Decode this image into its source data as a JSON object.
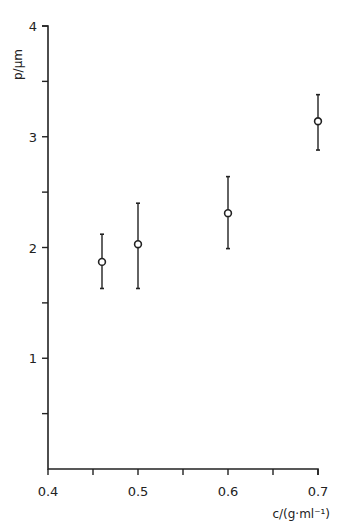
{
  "chart_data": {
    "type": "scatter",
    "title": "",
    "xlabel": "c/(g·ml⁻¹)",
    "ylabel": "p/µm",
    "xlim": [
      0.4,
      0.7
    ],
    "ylim": [
      0,
      4
    ],
    "x_ticks": [
      0.4,
      0.45,
      0.5,
      0.55,
      0.6,
      0.65,
      0.7
    ],
    "x_tick_labels": [
      "0.4",
      "",
      "0.5",
      "",
      "0.6",
      "",
      "0.7"
    ],
    "y_ticks": [
      0.5,
      1,
      1.5,
      2,
      2.5,
      3,
      3.5,
      4
    ],
    "y_tick_labels": [
      "",
      "1",
      "",
      "2",
      "",
      "3",
      "",
      "4"
    ],
    "grid": false,
    "legend": null,
    "marker": "open-circle",
    "error_bars": true,
    "series": [
      {
        "name": "p",
        "x": [
          0.46,
          0.5,
          0.6,
          0.7
        ],
        "y": [
          1.87,
          2.03,
          2.31,
          3.14
        ],
        "y_upper": [
          2.12,
          2.4,
          2.64,
          3.38
        ],
        "y_lower": [
          1.63,
          1.63,
          1.99,
          2.88
        ]
      }
    ]
  },
  "labels": {
    "y_axis_title": "p/µm",
    "x_axis_title": "c/(g·ml⁻¹)"
  }
}
